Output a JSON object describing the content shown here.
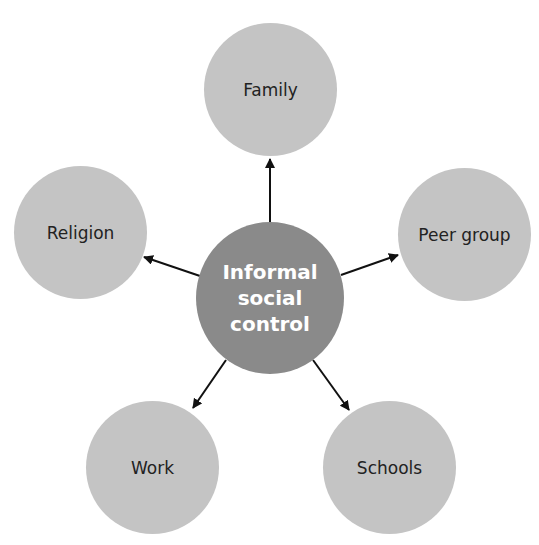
{
  "diagram": {
    "type": "hub-and-spoke",
    "colors": {
      "center_fill": "#8a8a8a",
      "center_text": "#ffffff",
      "outer_fill": "#c4c4c4",
      "outer_text": "#222222",
      "arrow": "#111111",
      "background": "#ffffff"
    },
    "center": {
      "lines": [
        "Informal",
        "social",
        "control"
      ]
    },
    "nodes": {
      "family": {
        "label": "Family"
      },
      "religion": {
        "label": "Religion"
      },
      "peer_group": {
        "label": "Peer group"
      },
      "work": {
        "label": "Work"
      },
      "schools": {
        "label": "Schools"
      }
    },
    "edges": [
      {
        "from": "Informal social control",
        "to": "Family"
      },
      {
        "from": "Informal social control",
        "to": "Religion"
      },
      {
        "from": "Informal social control",
        "to": "Peer group"
      },
      {
        "from": "Informal social control",
        "to": "Work"
      },
      {
        "from": "Informal social control",
        "to": "Schools"
      }
    ]
  }
}
